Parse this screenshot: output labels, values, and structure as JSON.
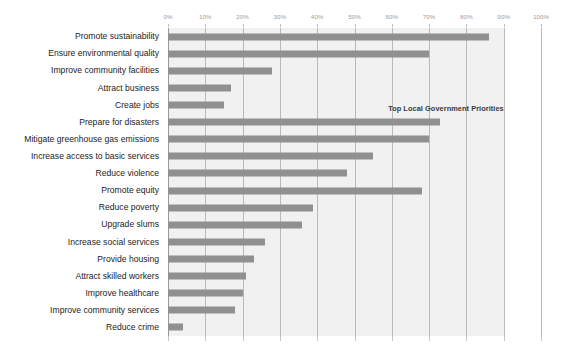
{
  "chart_data": {
    "type": "bar",
    "orientation": "horizontal",
    "title": "",
    "annotation": "Top Local Government Priorities",
    "xlabel": "",
    "ylabel": "",
    "xlim": [
      0,
      100
    ],
    "grid": true,
    "legend": false,
    "bar_color": "#909090",
    "plot_band_color": "#f1f1f1",
    "gridline_color": "#b9b9b9",
    "tick_labels": [
      "0%",
      "10%",
      "20%",
      "30%",
      "40%",
      "50%",
      "60%",
      "70%",
      "80%",
      "90%",
      "100%"
    ],
    "tick_values": [
      0,
      10,
      20,
      30,
      40,
      50,
      60,
      70,
      80,
      90,
      100
    ],
    "categories": [
      "Promote sustainability",
      "Ensure environmental quality",
      "Improve community facilities",
      "Attract business",
      "Create jobs",
      "Prepare for disasters",
      "Mitigate greenhouse gas emissions",
      "Increase access to basic services",
      "Reduce violence",
      "Promote equity",
      "Reduce poverty",
      "Upgrade slums",
      "Increase social services",
      "Provide housing",
      "Attract skilled workers",
      "Improve healthcare",
      "Improve community services",
      "Reduce crime"
    ],
    "values": [
      86,
      70,
      28,
      17,
      15,
      73,
      70,
      55,
      48,
      68,
      39,
      36,
      26,
      23,
      21,
      20,
      18,
      4
    ]
  }
}
